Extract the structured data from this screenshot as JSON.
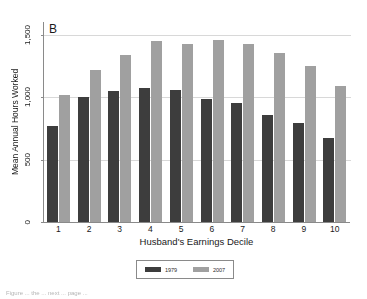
{
  "figure": {
    "panel_label": "B",
    "caption_fragment": "Figure ... the ... next ... page ..."
  },
  "chart_data": {
    "type": "bar",
    "title": "B",
    "xlabel": "Husband's Earnings Decile",
    "ylabel": "Mean Annual Hours Worked",
    "categories": [
      "1",
      "2",
      "3",
      "4",
      "5",
      "6",
      "7",
      "8",
      "9",
      "10"
    ],
    "series": [
      {
        "name": "1979",
        "color": "#3d3d3d",
        "values": [
          770,
          1000,
          1050,
          1075,
          1060,
          985,
          955,
          860,
          795,
          670
        ]
      },
      {
        "name": "2007",
        "color": "#a0a0a0",
        "values": [
          1020,
          1220,
          1340,
          1450,
          1425,
          1460,
          1425,
          1355,
          1250,
          1090
        ]
      }
    ],
    "ylim": [
      0,
      1600
    ],
    "yticks": [
      0,
      500,
      1000,
      1500
    ],
    "ytick_labels": [
      "0",
      "500",
      "1,000",
      "1,500"
    ],
    "grid": true,
    "legend_position": "bottom-center"
  },
  "legend": {
    "items": [
      {
        "label": "1979",
        "color": "#3d3d3d"
      },
      {
        "label": "2007",
        "color": "#a0a0a0"
      }
    ]
  },
  "colors": {
    "series_1979": "#3d3d3d",
    "series_2007": "#a0a0a0",
    "axis": "#8a8a8a",
    "grid": "#d8d8d8",
    "background": "#ffffff"
  }
}
